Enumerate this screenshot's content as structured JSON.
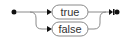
{
  "diagram": {
    "type": "railroad",
    "start_marker": "start-dot",
    "end_marker": "end-bar-dot",
    "choices": [
      {
        "label": "true"
      },
      {
        "label": "false"
      }
    ],
    "colors": {
      "line": "#8a8a8a",
      "marker": "#111111",
      "text": "#333333"
    }
  }
}
